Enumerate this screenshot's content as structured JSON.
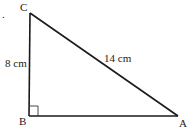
{
  "diagram": {
    "type": "right-triangle",
    "vertices": {
      "A": {
        "label": "A"
      },
      "B": {
        "label": "B"
      },
      "C": {
        "label": "C"
      }
    },
    "sides": {
      "BC": {
        "label": "8 cm"
      },
      "CA": {
        "label": "14 cm"
      }
    },
    "right_angle_at": "B",
    "bullet": "."
  }
}
